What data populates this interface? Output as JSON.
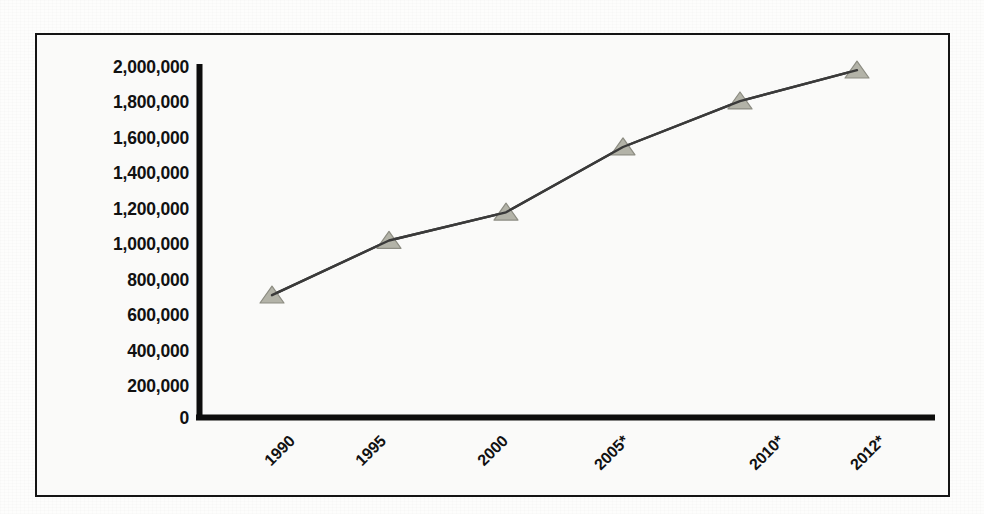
{
  "chart_data": {
    "type": "line",
    "title": "",
    "subtitle": "",
    "xlabel": "",
    "ylabel": "",
    "categories": [
      "1990",
      "1995",
      "2000",
      "2005*",
      "2010*",
      "2012*"
    ],
    "values": [
      690000,
      1000000,
      1160000,
      1530000,
      1790000,
      1965000
    ],
    "series": [
      {
        "name": "",
        "values": [
          690000,
          1000000,
          1160000,
          1530000,
          1790000,
          1965000
        ]
      }
    ],
    "ylim": [
      0,
      2000000
    ],
    "ytick_values": [
      0,
      200000,
      400000,
      600000,
      800000,
      1000000,
      1200000,
      1400000,
      1600000,
      1800000,
      2000000
    ],
    "ytick_labels": [
      "0",
      "200,000",
      "400,000",
      "600,000",
      "800,000",
      "1,000,000",
      "1,200,000",
      "1,400,000",
      "1,600,000",
      "1,800,000",
      "2,000,000"
    ],
    "xtick_labels": [
      "1990",
      "1995",
      "2000",
      "2005*",
      "2010*",
      "2012*"
    ],
    "xtick_rotation_deg": -45,
    "grid": false,
    "legend": false,
    "legend_position": "none",
    "marker": "triangle",
    "annotations": []
  },
  "style": {
    "line_color": "#3a3a3a",
    "marker_fill": "#b3b3a8",
    "marker_edge": "#8c8c82",
    "axis_color": "#0d0d0d",
    "frame_color": "#141414",
    "text_color": "#111111",
    "plot_background": "#fafaf9",
    "page_background": "#fdfdfc"
  },
  "geometry": {
    "axis_x": 199,
    "axis_top": 64,
    "axis_bottom": 417,
    "axis_right": 935,
    "point_x": [
      272,
      363,
      485,
      602,
      757,
      857
    ],
    "point_y": [
      296,
      243,
      213,
      148,
      103,
      73
    ]
  }
}
